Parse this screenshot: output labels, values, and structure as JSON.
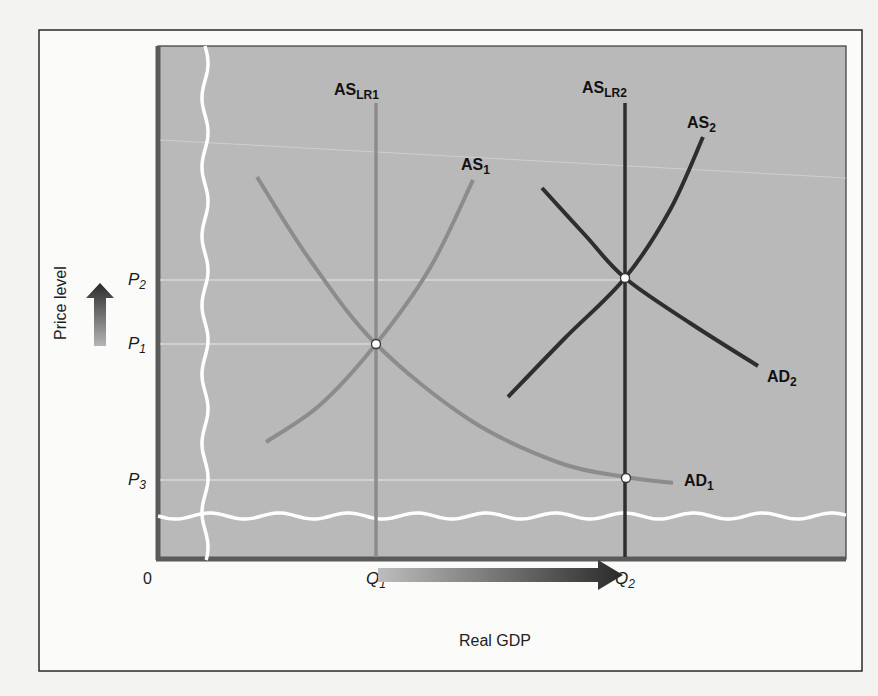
{
  "chart_data": {
    "type": "line",
    "title": "",
    "xlabel": "Real GDP",
    "ylabel": "Price level",
    "origin_label": "0",
    "x_ticks": [
      {
        "label": "Q",
        "sub": "1",
        "x": 376
      },
      {
        "label": "Q",
        "sub": "2",
        "x": 625
      }
    ],
    "y_ticks": [
      {
        "label": "P",
        "sub": "2",
        "y": 280
      },
      {
        "label": "P",
        "sub": "1",
        "y": 344
      },
      {
        "label": "P",
        "sub": "3",
        "y": 480
      }
    ],
    "axis_breaks": {
      "vertical": true,
      "horizontal": true
    },
    "grid": false,
    "legend": "none (curves labeled inline)",
    "series": [
      {
        "name": "AS_LR1",
        "label": "AS",
        "sub": "LR1",
        "kind": "vertical",
        "color": "#8c8c8c",
        "points": [
          [
            376,
            103
          ],
          [
            376,
            557
          ]
        ],
        "label_pos": [
          334,
          95
        ]
      },
      {
        "name": "AS_LR2",
        "label": "AS",
        "sub": "LR2",
        "kind": "vertical",
        "color": "#2e2e2e",
        "points": [
          [
            625,
            103
          ],
          [
            625,
            557
          ]
        ],
        "label_pos": [
          582,
          93
        ]
      },
      {
        "name": "AS_1",
        "label": "AS",
        "sub": "1",
        "kind": "upward",
        "color": "#8c8c8c",
        "points": [
          [
            266,
            442
          ],
          [
            320,
            405
          ],
          [
            376,
            344
          ],
          [
            430,
            268
          ],
          [
            473,
            180
          ]
        ],
        "label_pos": [
          461,
          170
        ]
      },
      {
        "name": "AS_2",
        "label": "AS",
        "sub": "2",
        "kind": "upward",
        "color": "#2e2e2e",
        "points": [
          [
            508,
            397
          ],
          [
            565,
            338
          ],
          [
            625,
            278
          ],
          [
            670,
            210
          ],
          [
            703,
            137
          ]
        ],
        "label_pos": [
          687,
          128
        ]
      },
      {
        "name": "AD_1",
        "label": "AD",
        "sub": "1",
        "kind": "downward",
        "color": "#8c8c8c",
        "points": [
          [
            257,
            177
          ],
          [
            310,
            260
          ],
          [
            376,
            344
          ],
          [
            470,
            420
          ],
          [
            560,
            463
          ],
          [
            626,
            477
          ],
          [
            673,
            483
          ]
        ],
        "label_pos": [
          684,
          486
        ]
      },
      {
        "name": "AD_2",
        "label": "AD",
        "sub": "2",
        "kind": "downward",
        "color": "#2e2e2e",
        "points": [
          [
            542,
            188
          ],
          [
            585,
            235
          ],
          [
            625,
            278
          ],
          [
            690,
            323
          ],
          [
            758,
            366
          ]
        ],
        "label_pos": [
          767,
          382
        ]
      }
    ],
    "equilibria": [
      {
        "name": "E1",
        "x": 376,
        "y": 344,
        "q": "Q1",
        "p": "P1"
      },
      {
        "name": "E2",
        "x": 625,
        "y": 278,
        "q": "Q2",
        "p": "P2"
      },
      {
        "name": "E3",
        "x": 626,
        "y": 478,
        "q": "Q2",
        "p": "P3"
      }
    ],
    "annotations": [
      {
        "type": "arrow",
        "direction": "up",
        "meaning": "price level increases"
      },
      {
        "type": "arrow",
        "direction": "right",
        "from": "Q1",
        "to": "Q2",
        "meaning": "real GDP increases"
      }
    ]
  },
  "colors": {
    "page_bg": "#f3f3f1",
    "plot_bg": "#b9b9b9",
    "frame": "#3a3a3a",
    "axis": "#5a5a5a",
    "light_curve": "#8c8c8c",
    "dark_curve": "#2e2e2e",
    "guide": "#e8e8e8"
  }
}
